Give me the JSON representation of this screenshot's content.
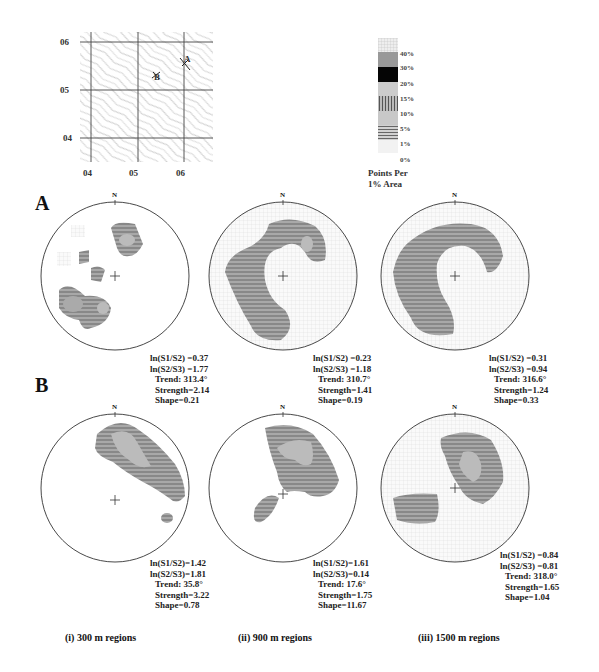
{
  "figure": {
    "map": {
      "y_ticks": [
        "06",
        "05",
        "04"
      ],
      "x_ticks": [
        "04",
        "05",
        "06"
      ],
      "points": [
        {
          "label": "A"
        },
        {
          "label": "B"
        }
      ]
    },
    "legend": {
      "title": "Points Per\n1% Area",
      "title_line1": "Points Per",
      "title_line2": "1% Area",
      "levels": [
        "40%",
        "30%",
        "20%",
        "15%",
        "10%",
        "5%",
        "1%",
        "0%"
      ]
    },
    "rows": [
      {
        "label": "A",
        "plots": [
          {
            "north": "N",
            "ln_s1_s2": "ln(S1/S2) =0.37",
            "ln_s2_s3": "ln(S2/S3) =1.77",
            "trend": "Trend: 313.4°",
            "strength": "Strength=2.14",
            "shape": "Shape=0.21"
          },
          {
            "north": "N",
            "ln_s1_s2": "ln(S1/S2) =0.23",
            "ln_s2_s3": "ln(S2/S3) =1.18",
            "trend": "Trend: 310.7°",
            "strength": "Strength=1.41",
            "shape": "Shape=0.19"
          },
          {
            "north": "N",
            "ln_s1_s2": "ln(S1/S2) =0.31",
            "ln_s2_s3": "ln(S2/S3) =0.94",
            "trend": "Trend: 316.6°",
            "strength": "Strength=1.24",
            "shape": "Shape=0.33"
          }
        ]
      },
      {
        "label": "B",
        "plots": [
          {
            "north": "N",
            "ln_s1_s2": "ln(S1/S2)=1.42",
            "ln_s2_s3": "ln(S2/S3)=1.81",
            "trend": "Trend: 35.8°",
            "strength": "Strength=3.22",
            "shape": "Shape=0.78"
          },
          {
            "north": "N",
            "ln_s1_s2": "ln(S1/S2)=1.61",
            "ln_s2_s3": "ln(S2/S3)=0.14",
            "trend": "Trend: 17.6°",
            "strength": "Strength=1.75",
            "shape": "Shape=11.67"
          },
          {
            "north": "N",
            "ln_s1_s2": "ln(S1/S2) =0.84",
            "ln_s2_s3": "ln(S2/S3) =0.81",
            "trend": "Trend: 318.0°",
            "strength": "Strength=1.65",
            "shape": "Shape=1.04"
          }
        ]
      }
    ],
    "captions": [
      "(i) 300 m regions",
      "(ii) 900 m regions",
      "(iii) 1500 m regions"
    ]
  }
}
